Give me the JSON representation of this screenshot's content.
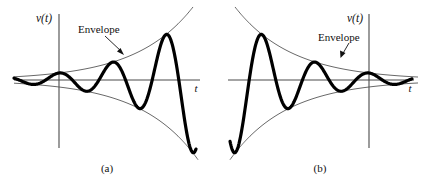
{
  "figure": {
    "background_color": "#ffffff",
    "signal_color": "#000000",
    "envelope_color": "#4d4d4d",
    "axis_color": "#4a4a4a",
    "text_color": "#111111",
    "width": 431,
    "height": 184
  },
  "panels": [
    {
      "id": "a",
      "caption": "(a)",
      "y_axis_label": "v(t)",
      "x_axis_label": "t",
      "annotation": "Envelope",
      "description": "Exponentially growing sinusoid with diverging envelope"
    },
    {
      "id": "b",
      "caption": "(b)",
      "y_axis_label": "v(t)",
      "x_axis_label": "t",
      "annotation": "Envelope",
      "description": "Exponentially decaying sinusoid with converging envelope"
    }
  ],
  "chart_data": [
    {
      "type": "line",
      "title": "(a)",
      "xlabel": "t",
      "ylabel": "v(t)",
      "grid": false,
      "legend": null,
      "annotations": [
        {
          "text": "Envelope",
          "x": 78,
          "y": 30,
          "points_to": "upper-envelope"
        }
      ],
      "axis_origin_px": {
        "x": 59,
        "y": 80
      },
      "series": [
        {
          "name": "v(t) = A e^{+at} cos(wt)",
          "kind": "signal",
          "form": "growing-sinusoid",
          "amplitude_A": 7,
          "growth_rate": 0.0175,
          "angular_freq_w": 0.118,
          "phase": 0.0,
          "t_range_px": [
            14,
            196
          ]
        },
        {
          "name": "upper envelope +A e^{+at}",
          "kind": "envelope",
          "sign": 1,
          "amplitude_A": 7,
          "growth_rate": 0.0175,
          "t_range_px": [
            14,
            200
          ]
        },
        {
          "name": "lower envelope -A e^{+at}",
          "kind": "envelope",
          "sign": -1,
          "amplitude_A": 7,
          "growth_rate": 0.0175,
          "t_range_px": [
            14,
            200
          ]
        }
      ]
    },
    {
      "type": "line",
      "title": "(b)",
      "xlabel": "t",
      "ylabel": "v(t)",
      "grid": false,
      "legend": null,
      "annotations": [
        {
          "text": "Envelope",
          "x": 102,
          "y": 38,
          "points_to": "upper-envelope"
        }
      ],
      "axis_origin_px": {
        "x": 153,
        "y": 80
      },
      "series": [
        {
          "name": "v(t) = A e^{-at} cos(wt)",
          "kind": "signal",
          "form": "decaying-sinusoid",
          "amplitude_A": 7,
          "decay_rate": 0.0175,
          "angular_freq_w": 0.118,
          "phase": 0.0,
          "t_range_px": [
            14,
            196
          ]
        },
        {
          "name": "upper envelope +A e^{-at}",
          "kind": "envelope",
          "sign": 1,
          "amplitude_A": 7,
          "decay_rate": 0.0175,
          "t_range_px": [
            8,
            202
          ]
        },
        {
          "name": "lower envelope -A e^{-at}",
          "kind": "envelope",
          "sign": -1,
          "amplitude_A": 7,
          "decay_rate": 0.0175,
          "t_range_px": [
            8,
            202
          ]
        }
      ]
    }
  ]
}
